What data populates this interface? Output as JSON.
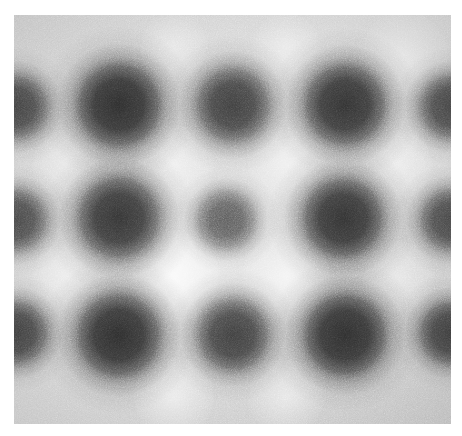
{
  "page": {
    "width": 462,
    "height": 436,
    "background_color": "#ffffff",
    "alt_text": ""
  },
  "image_panel": {
    "name": "grayscale-micrograph",
    "left": 14,
    "top": 15,
    "width": 437,
    "height": 409,
    "background_color": "#c8c8c8",
    "min_gray": "#2a2a2a",
    "max_gray": "#f2f2f2",
    "noise_opacity": 0.52,
    "caption": ""
  },
  "chart_data": {
    "type": "heatmap",
    "title": "",
    "subtitle": "",
    "xlabel": "",
    "ylabel": "",
    "colormap": "grayscale",
    "grid": false,
    "legend": "none",
    "xlim": [
      0,
      437
    ],
    "ylim": [
      0,
      409
    ],
    "lattice": {
      "rows": 3,
      "cols": 3,
      "column_spacing": 113,
      "row_spacing": 115,
      "edge_partials": 4
    },
    "spots": [
      {
        "id": "r1c0",
        "cx": 2,
        "cy": 92,
        "r": 30,
        "depth": 0.82,
        "partial": true
      },
      {
        "id": "r1c1",
        "cx": 105,
        "cy": 90,
        "r": 40,
        "depth": 0.94,
        "partial": false
      },
      {
        "id": "r1c2",
        "cx": 219,
        "cy": 90,
        "r": 35,
        "depth": 0.86,
        "partial": false
      },
      {
        "id": "r1c3",
        "cx": 331,
        "cy": 90,
        "r": 39,
        "depth": 0.93,
        "partial": false
      },
      {
        "id": "r1c4",
        "cx": 437,
        "cy": 92,
        "r": 30,
        "depth": 0.82,
        "partial": true
      },
      {
        "id": "r2c0",
        "cx": 2,
        "cy": 205,
        "r": 29,
        "depth": 0.8,
        "partial": true
      },
      {
        "id": "r2c1",
        "cx": 105,
        "cy": 203,
        "r": 39,
        "depth": 0.92,
        "partial": false
      },
      {
        "id": "r2c2",
        "cx": 212,
        "cy": 205,
        "r": 27,
        "depth": 0.72,
        "partial": false
      },
      {
        "id": "r2c3",
        "cx": 329,
        "cy": 203,
        "r": 38,
        "depth": 0.92,
        "partial": false
      },
      {
        "id": "r2c4",
        "cx": 437,
        "cy": 205,
        "r": 29,
        "depth": 0.8,
        "partial": true
      },
      {
        "id": "r3c0",
        "cx": 2,
        "cy": 318,
        "r": 30,
        "depth": 0.84,
        "partial": true
      },
      {
        "id": "r3c1",
        "cx": 105,
        "cy": 320,
        "r": 40,
        "depth": 0.95,
        "partial": false
      },
      {
        "id": "r3c2",
        "cx": 219,
        "cy": 320,
        "r": 34,
        "depth": 0.86,
        "partial": false
      },
      {
        "id": "r3c3",
        "cx": 331,
        "cy": 320,
        "r": 39,
        "depth": 0.93,
        "partial": false
      },
      {
        "id": "r3c4",
        "cx": 437,
        "cy": 318,
        "r": 30,
        "depth": 0.84,
        "partial": true
      }
    ],
    "highlights": [
      {
        "cx": 160,
        "cy": 150,
        "r": 40,
        "strength": 0.55
      },
      {
        "cx": 272,
        "cy": 150,
        "r": 38,
        "strength": 0.5
      },
      {
        "cx": 52,
        "cy": 150,
        "r": 34,
        "strength": 0.4
      },
      {
        "cx": 385,
        "cy": 150,
        "r": 34,
        "strength": 0.42
      },
      {
        "cx": 160,
        "cy": 262,
        "r": 46,
        "strength": 0.72
      },
      {
        "cx": 272,
        "cy": 262,
        "r": 44,
        "strength": 0.68
      },
      {
        "cx": 52,
        "cy": 262,
        "r": 34,
        "strength": 0.42
      },
      {
        "cx": 385,
        "cy": 262,
        "r": 36,
        "strength": 0.45
      },
      {
        "cx": 160,
        "cy": 32,
        "r": 34,
        "strength": 0.4
      },
      {
        "cx": 272,
        "cy": 32,
        "r": 34,
        "strength": 0.4
      },
      {
        "cx": 160,
        "cy": 382,
        "r": 40,
        "strength": 0.55
      },
      {
        "cx": 272,
        "cy": 382,
        "r": 38,
        "strength": 0.5
      },
      {
        "cx": 390,
        "cy": 40,
        "r": 44,
        "strength": 0.45
      }
    ]
  }
}
